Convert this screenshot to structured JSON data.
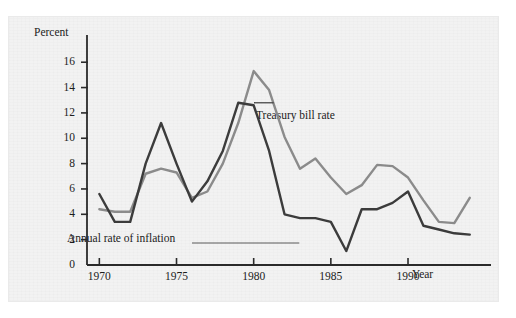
{
  "chart_data": {
    "type": "line",
    "title": "",
    "xlabel": "Year",
    "ylabel": "Percent",
    "xlim": [
      1969.2,
      1994.6
    ],
    "ylim": [
      0,
      17.2
    ],
    "ytick_values": [
      0,
      2,
      4,
      6,
      8,
      10,
      12,
      14,
      16
    ],
    "ytick_labels": [
      "0",
      "2",
      "4",
      "6",
      "8",
      "10",
      "12",
      "14",
      "16"
    ],
    "xtick_values": [
      1970,
      1975,
      1980,
      1985,
      1990
    ],
    "xtick_labels": [
      "1970",
      "1975",
      "1980",
      "1985",
      "1990"
    ],
    "grid": false,
    "legend": "annotations-on-plot",
    "x": [
      1970,
      1971,
      1972,
      1973,
      1974,
      1975,
      1976,
      1977,
      1978,
      1979,
      1980,
      1981,
      1982,
      1983,
      1984,
      1985,
      1986,
      1987,
      1988,
      1989,
      1990,
      1991,
      1992,
      1993,
      1994
    ],
    "series": [
      {
        "name": "Annual rate of inflation",
        "color": "#3c3c3c",
        "values": [
          5.6,
          3.4,
          3.4,
          8.0,
          11.2,
          8.0,
          5.0,
          6.6,
          9.0,
          12.8,
          12.6,
          9.0,
          4.0,
          3.7,
          3.7,
          3.4,
          1.1,
          4.4,
          4.4,
          4.9,
          5.8,
          3.1,
          2.8,
          2.5,
          2.4
        ]
      },
      {
        "name": "Treasury bill rate",
        "color": "#8c8c8c",
        "values": [
          4.4,
          4.2,
          4.2,
          7.2,
          7.6,
          7.3,
          5.3,
          5.8,
          8.0,
          11.2,
          15.3,
          13.8,
          10.1,
          7.6,
          8.4,
          6.9,
          5.6,
          6.3,
          7.9,
          7.8,
          6.9,
          5.1,
          3.4,
          3.3,
          5.3
        ]
      }
    ],
    "annotations": [
      {
        "text": "Treasury bill rate",
        "target_x": 1981.3,
        "target_y": 12.8
      },
      {
        "text": "Annual rate of inflation",
        "target_x": 1986.0,
        "target_y": 2.0
      }
    ]
  }
}
